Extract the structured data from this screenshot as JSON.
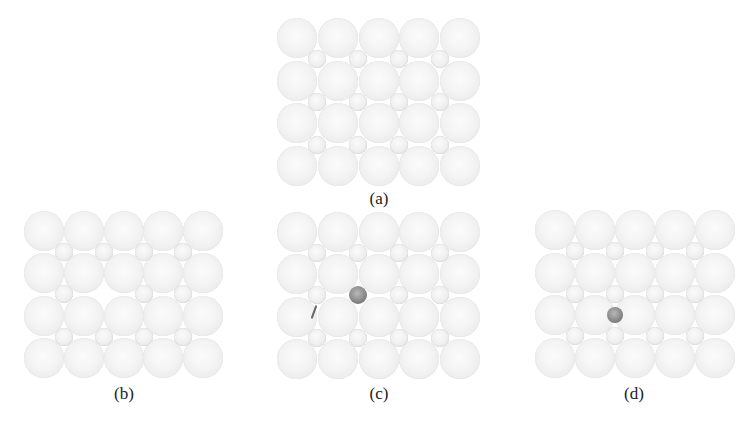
{
  "figure": {
    "colors": {
      "background": "#ffffff",
      "large_atom": "#f2f2f2",
      "large_atom_edge": "#d8d8d8",
      "small_atom": "#efefef",
      "dark_atom": "#808080",
      "label_text": "#222222"
    },
    "panels": [
      {
        "id": "a",
        "label": "(a)",
        "origin": [
          297,
          38
        ],
        "spacing": [
          40.8,
          42.7
        ],
        "large_radius": 20,
        "small_radius": 9,
        "grid": {
          "cols": 5,
          "rows": 4
        },
        "interstitial_grid": {
          "cols": 4,
          "rows": 3
        },
        "missing_interstitials": [],
        "dark_atoms": [],
        "label_pos": [
          379,
          200
        ]
      },
      {
        "id": "b",
        "label": "(b)",
        "origin": [
          44,
          231
        ],
        "spacing": [
          39.8,
          42.3
        ],
        "large_radius": 20,
        "small_radius": 9,
        "grid": {
          "cols": 5,
          "rows": 4
        },
        "interstitial_grid": {
          "cols": 4,
          "rows": 3
        },
        "missing_interstitials": [
          [
            1,
            1
          ]
        ],
        "dark_atoms": [],
        "label_pos": [
          124,
          395
        ]
      },
      {
        "id": "c",
        "label": "(c)",
        "origin": [
          297,
          232
        ],
        "spacing": [
          40.8,
          42.3
        ],
        "large_radius": 20,
        "small_radius": 9,
        "grid": {
          "cols": 5,
          "rows": 4
        },
        "interstitial_grid": {
          "cols": 4,
          "rows": 3
        },
        "missing_interstitials": [
          [
            1,
            1
          ]
        ],
        "dark_atoms": [
          {
            "x": 358,
            "y": 295,
            "r": 9
          }
        ],
        "stray_mark": {
          "x": 313,
          "y": 305
        },
        "label_pos": [
          379,
          395
        ]
      },
      {
        "id": "d",
        "label": "(d)",
        "origin": [
          555,
          230
        ],
        "spacing": [
          40,
          42.5
        ],
        "large_radius": 20,
        "small_radius": 9,
        "grid": {
          "cols": 5,
          "rows": 4
        },
        "interstitial_grid": {
          "cols": 4,
          "rows": 3
        },
        "missing_interstitials": [],
        "dark_atoms": [
          {
            "x": 615,
            "y": 315,
            "r": 8
          }
        ],
        "label_pos": [
          634,
          395
        ]
      }
    ]
  }
}
